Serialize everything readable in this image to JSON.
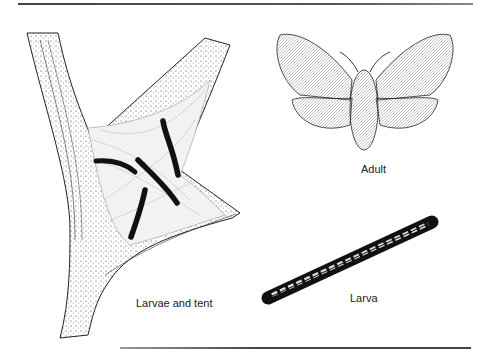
{
  "figure": {
    "panels": [
      {
        "id": "larvae-tent",
        "label": "Larvae and tent"
      },
      {
        "id": "adult",
        "label": "Adult"
      },
      {
        "id": "larva",
        "label": "Larva"
      }
    ]
  },
  "colors": {
    "ink": "#1a1a1a",
    "rule": "#555555",
    "background": "#ffffff"
  }
}
